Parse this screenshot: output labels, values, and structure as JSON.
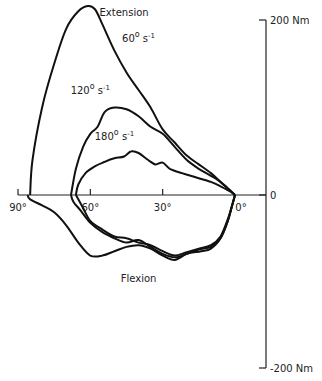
{
  "chart_data": {
    "type": "line",
    "title": "",
    "xlabel": "Joint angle",
    "ylabel": "Torque",
    "x_direction": "reversed",
    "xlim": [
      90,
      0
    ],
    "ylim": [
      -200,
      200
    ],
    "x_ticks": [
      {
        "value": 90,
        "label": "90°"
      },
      {
        "value": 60,
        "label": "60°"
      },
      {
        "value": 30,
        "label": "30°"
      },
      {
        "value": 0,
        "label": "0°"
      }
    ],
    "y_ticks": [
      {
        "value": 200,
        "label": "200 Nm"
      },
      {
        "value": 0,
        "label": "0"
      },
      {
        "value": -200,
        "label": "-200 Nm"
      }
    ],
    "annotations": [
      {
        "text": "Extension",
        "x": 46,
        "y": 205
      },
      {
        "text": "Flexion",
        "x": 40,
        "y": -100
      },
      {
        "text": "60° s-1",
        "x": 40,
        "y": 175,
        "speed": "60"
      },
      {
        "text": "120° s-1",
        "x": 60,
        "y": 115,
        "speed": "120"
      },
      {
        "text": "180° s-1",
        "x": 50,
        "y": 63,
        "speed": "180"
      }
    ],
    "series": [
      {
        "name": "60° s-1",
        "extension": [
          [
            85,
            0
          ],
          [
            84,
            40
          ],
          [
            80,
            100
          ],
          [
            75,
            150
          ],
          [
            70,
            190
          ],
          [
            65,
            210
          ],
          [
            61,
            216
          ],
          [
            58,
            212
          ],
          [
            55,
            195
          ],
          [
            50,
            165
          ],
          [
            45,
            140
          ],
          [
            40,
            120
          ],
          [
            35,
            100
          ],
          [
            30,
            75
          ],
          [
            25,
            60
          ],
          [
            20,
            45
          ],
          [
            15,
            35
          ],
          [
            10,
            25
          ],
          [
            6,
            15
          ],
          [
            2,
            5
          ],
          [
            0,
            0
          ]
        ],
        "flexion": [
          [
            0,
            0
          ],
          [
            1,
            -10
          ],
          [
            3,
            -30
          ],
          [
            6,
            -50
          ],
          [
            10,
            -62
          ],
          [
            14,
            -65
          ],
          [
            20,
            -68
          ],
          [
            25,
            -75
          ],
          [
            30,
            -70
          ],
          [
            35,
            -62
          ],
          [
            40,
            -58
          ],
          [
            45,
            -60
          ],
          [
            50,
            -65
          ],
          [
            55,
            -70
          ],
          [
            60,
            -70
          ],
          [
            65,
            -55
          ],
          [
            70,
            -35
          ],
          [
            75,
            -20
          ],
          [
            80,
            -12
          ],
          [
            85,
            -5
          ],
          [
            86,
            0
          ]
        ]
      },
      {
        "name": "120° s-1",
        "extension": [
          [
            68,
            0
          ],
          [
            66,
            30
          ],
          [
            63,
            55
          ],
          [
            60,
            70
          ],
          [
            57,
            78
          ],
          [
            54,
            95
          ],
          [
            50,
            100
          ],
          [
            45,
            98
          ],
          [
            40,
            90
          ],
          [
            35,
            78
          ],
          [
            30,
            70
          ],
          [
            25,
            55
          ],
          [
            20,
            40
          ],
          [
            15,
            30
          ],
          [
            10,
            22
          ],
          [
            6,
            15
          ],
          [
            2,
            5
          ],
          [
            0,
            0
          ]
        ],
        "flexion": [
          [
            0,
            0
          ],
          [
            1,
            -10
          ],
          [
            3,
            -30
          ],
          [
            6,
            -50
          ],
          [
            10,
            -60
          ],
          [
            15,
            -63
          ],
          [
            20,
            -68
          ],
          [
            25,
            -72
          ],
          [
            30,
            -68
          ],
          [
            35,
            -60
          ],
          [
            40,
            -52
          ],
          [
            45,
            -55
          ],
          [
            50,
            -50
          ],
          [
            55,
            -43
          ],
          [
            60,
            -32
          ],
          [
            64,
            -18
          ],
          [
            67,
            -8
          ],
          [
            68,
            0
          ]
        ]
      },
      {
        "name": "180° s-1",
        "extension": [
          [
            66,
            0
          ],
          [
            65,
            12
          ],
          [
            62,
            25
          ],
          [
            58,
            33
          ],
          [
            54,
            38
          ],
          [
            50,
            42
          ],
          [
            46,
            44
          ],
          [
            43,
            50
          ],
          [
            40,
            48
          ],
          [
            36,
            40
          ],
          [
            33,
            35
          ],
          [
            30,
            37
          ],
          [
            27,
            30
          ],
          [
            22,
            25
          ],
          [
            16,
            20
          ],
          [
            10,
            15
          ],
          [
            6,
            10
          ],
          [
            2,
            4
          ],
          [
            0,
            0
          ]
        ],
        "flexion": [
          [
            0,
            0
          ],
          [
            1,
            -10
          ],
          [
            3,
            -28
          ],
          [
            6,
            -48
          ],
          [
            10,
            -58
          ],
          [
            15,
            -62
          ],
          [
            20,
            -66
          ],
          [
            25,
            -70
          ],
          [
            30,
            -65
          ],
          [
            35,
            -58
          ],
          [
            40,
            -55
          ],
          [
            45,
            -50
          ],
          [
            50,
            -48
          ],
          [
            55,
            -40
          ],
          [
            60,
            -30
          ],
          [
            63,
            -15
          ],
          [
            65,
            -5
          ],
          [
            66,
            0
          ]
        ]
      }
    ]
  }
}
